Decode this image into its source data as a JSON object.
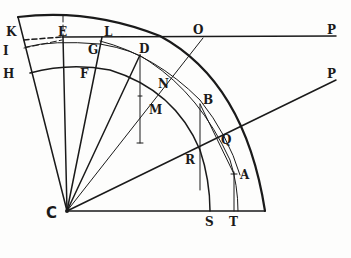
{
  "diagram": {
    "title": "",
    "center_label": "C",
    "points": [
      {
        "id": "K",
        "label": "K",
        "x": 6,
        "y": 36
      },
      {
        "id": "E",
        "label": "E",
        "x": 58,
        "y": 36
      },
      {
        "id": "L",
        "label": "L",
        "x": 104,
        "y": 36
      },
      {
        "id": "O",
        "label": "O",
        "x": 193,
        "y": 34
      },
      {
        "id": "P1",
        "label": "P",
        "x": 327,
        "y": 34
      },
      {
        "id": "I",
        "label": "I",
        "x": 3,
        "y": 55
      },
      {
        "id": "G",
        "label": "G",
        "x": 88,
        "y": 54
      },
      {
        "id": "D",
        "label": "D",
        "x": 139,
        "y": 53
      },
      {
        "id": "H",
        "label": "H",
        "x": 3,
        "y": 78
      },
      {
        "id": "F",
        "label": "F",
        "x": 80,
        "y": 78
      },
      {
        "id": "N",
        "label": "N",
        "x": 158,
        "y": 88
      },
      {
        "id": "M",
        "label": "M",
        "x": 149,
        "y": 114
      },
      {
        "id": "B",
        "label": "B",
        "x": 203,
        "y": 104
      },
      {
        "id": "P2",
        "label": "P",
        "x": 327,
        "y": 78
      },
      {
        "id": "Q",
        "label": "Q",
        "x": 221,
        "y": 144
      },
      {
        "id": "R",
        "label": "R",
        "x": 185,
        "y": 164
      },
      {
        "id": "A",
        "label": "A",
        "x": 240,
        "y": 179
      },
      {
        "id": "S",
        "label": "S",
        "x": 205,
        "y": 226
      },
      {
        "id": "T",
        "label": "T",
        "x": 229,
        "y": 226
      }
    ],
    "geometry": {
      "center": [
        67,
        211
      ],
      "outer_radius": 198,
      "middle_radius": 173,
      "inner_radius": 145
    },
    "stroke_color": "#1a1a1a",
    "background_color": "#fdfdfc"
  }
}
